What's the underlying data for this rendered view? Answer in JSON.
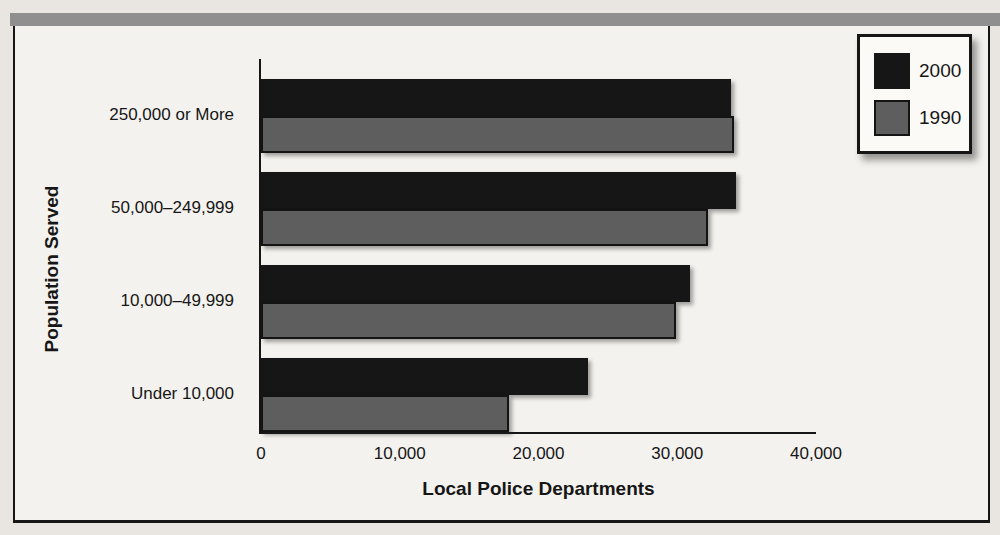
{
  "figure": {
    "page_background": "#e9e6e1",
    "plot_background": "#f4f2ee",
    "top_band_color": "#8f8f8f",
    "border_color": "#161616"
  },
  "chart_data": {
    "type": "bar",
    "orientation": "horizontal",
    "title": "",
    "xlabel": "Local Police Departments",
    "ylabel": "Population Served",
    "categories": [
      "250,000 or More",
      "50,000–249,999",
      "10,000–49,999",
      "Under 10,000"
    ],
    "series": [
      {
        "name": "2000",
        "color": "#161616",
        "values": [
          33900,
          34200,
          30900,
          23600
        ]
      },
      {
        "name": "1990",
        "color": "#5e5e5e",
        "values": [
          34100,
          32200,
          29900,
          17900
        ]
      }
    ],
    "xlim": [
      0,
      40000
    ],
    "xticks": [
      0,
      10000,
      20000,
      30000,
      40000
    ],
    "xtick_labels": [
      "0",
      "10,000",
      "20,000",
      "30,000",
      "40,000"
    ],
    "grid": false,
    "legend_position": "top-right"
  }
}
